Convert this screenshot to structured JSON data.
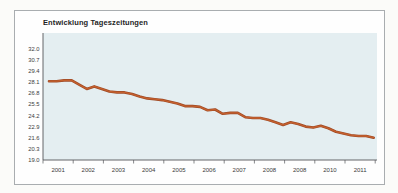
{
  "page": {
    "background": "#fbfbf9"
  },
  "panel": {
    "background": "#fefefe",
    "border_color": "#a9adb0"
  },
  "chart_data": {
    "type": "line",
    "title": "Entwicklung Tageszeitungen",
    "series_name": "Tageszeitungen",
    "x": [
      2001.2,
      2001.45,
      2001.7,
      2001.95,
      2002.2,
      2002.45,
      2002.7,
      2002.95,
      2003.2,
      2003.45,
      2003.7,
      2003.95,
      2004.2,
      2004.45,
      2004.7,
      2004.95,
      2005.2,
      2005.45,
      2005.7,
      2005.95,
      2006.2,
      2006.45,
      2006.7,
      2006.95,
      2007.2,
      2007.45,
      2007.7,
      2007.95,
      2008.2,
      2008.45,
      2008.7,
      2008.95,
      2009.2,
      2009.45,
      2009.7,
      2009.95,
      2010.2,
      2010.45,
      2010.7,
      2010.95,
      2011.2,
      2011.45,
      2011.7,
      2011.95
    ],
    "values": [
      28.2,
      28.2,
      28.3,
      28.3,
      27.8,
      27.3,
      27.6,
      27.3,
      27.0,
      26.9,
      26.9,
      26.7,
      26.4,
      26.2,
      26.1,
      26.0,
      25.8,
      25.6,
      25.3,
      25.3,
      25.2,
      24.8,
      24.9,
      24.4,
      24.5,
      24.5,
      24.0,
      23.9,
      23.9,
      23.7,
      23.4,
      23.1,
      23.4,
      23.2,
      22.9,
      22.8,
      23.0,
      22.7,
      22.3,
      22.1,
      21.9,
      21.8,
      21.8,
      21.6
    ],
    "x_tick_labels": [
      "2001",
      "2002",
      "2003",
      "2004",
      "2005",
      "2006",
      "2007",
      "2008",
      "2008",
      "2010",
      "2011"
    ],
    "y_tick_labels": [
      "19.0",
      "20.3",
      "21.6",
      "22.9",
      "24.2",
      "25.5",
      "26.8",
      "28.1",
      "29.4",
      "30.7",
      "32.0"
    ],
    "ylim": [
      19.0,
      32.0
    ],
    "xlim": [
      2001,
      2012
    ],
    "grid": false,
    "legend": false,
    "line_color": "#9e4a26",
    "line_color_highlight": "#c5602e",
    "plot_background": "#e4eef1",
    "axis_color": "#55565a",
    "label_color": "#3b3b3b"
  }
}
